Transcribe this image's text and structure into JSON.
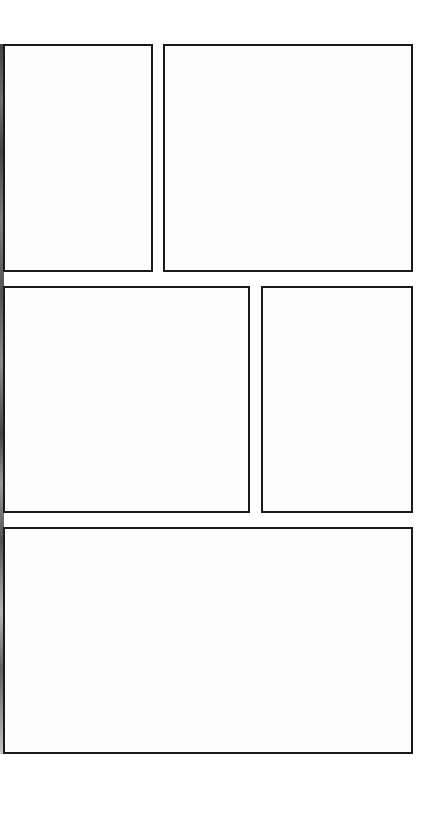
{
  "layout": {
    "type": "panel-grid",
    "rows": 3,
    "colors": {
      "background": "#ffffff",
      "panel_border": "#1a1a1a",
      "panel_fill": "#fdfdfd"
    }
  },
  "panels": [
    {
      "id": "panel-1",
      "row": 1,
      "label": ""
    },
    {
      "id": "panel-2",
      "row": 1,
      "label": ""
    },
    {
      "id": "panel-3",
      "row": 2,
      "label": ""
    },
    {
      "id": "panel-4",
      "row": 2,
      "label": ""
    },
    {
      "id": "panel-5",
      "row": 3,
      "label": ""
    }
  ]
}
